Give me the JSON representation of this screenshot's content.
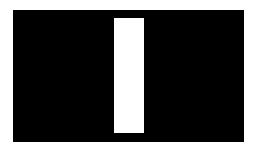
{
  "canvas": {
    "background": "#ffffff"
  },
  "panel": {
    "color": "#000000"
  },
  "bar": {
    "color": "#ffffff"
  }
}
